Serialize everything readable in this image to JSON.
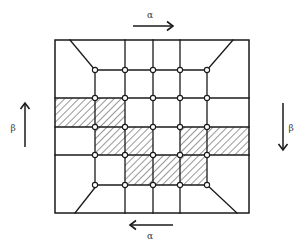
{
  "diagram": {
    "colors": {
      "ink": "#1a1a1a",
      "background": "#ffffff",
      "label": "#444444"
    },
    "frame": {
      "left": 55,
      "top": 40,
      "right": 249,
      "bottom": 213
    },
    "grid_x": [
      95,
      125,
      153,
      180,
      207
    ],
    "grid_y": [
      70,
      98,
      127,
      155,
      185
    ],
    "full_horizontal_rows": [
      98,
      127,
      155
    ],
    "full_vertical_cols": [
      125,
      153,
      180
    ],
    "diagonals": [
      {
        "x1": 70,
        "y1": 40,
        "x2": 95,
        "y2": 70
      },
      {
        "x1": 233,
        "y1": 40,
        "x2": 207,
        "y2": 70
      },
      {
        "x1": 75,
        "y1": 213,
        "x2": 97,
        "y2": 185
      },
      {
        "x1": 237,
        "y1": 213,
        "x2": 207,
        "y2": 185
      }
    ],
    "hatched_cells": [
      {
        "x": 55,
        "y": 98,
        "w": 40,
        "h": 29
      },
      {
        "x": 95,
        "y": 98,
        "w": 30,
        "h": 29
      },
      {
        "x": 95,
        "y": 127,
        "w": 30,
        "h": 28
      },
      {
        "x": 125,
        "y": 127,
        "w": 28,
        "h": 28
      },
      {
        "x": 180,
        "y": 127,
        "w": 27,
        "h": 28
      },
      {
        "x": 207,
        "y": 127,
        "w": 42,
        "h": 28
      },
      {
        "x": 125,
        "y": 155,
        "w": 28,
        "h": 30
      },
      {
        "x": 153,
        "y": 155,
        "w": 27,
        "h": 30
      },
      {
        "x": 180,
        "y": 155,
        "w": 27,
        "h": 30
      }
    ],
    "arrows": {
      "top": {
        "label": "α",
        "direction": "right",
        "x1": 133,
        "y1": 26,
        "x2": 173,
        "y2": 26,
        "label_x": 150,
        "label_y": 18
      },
      "bottom": {
        "label": "α",
        "direction": "left",
        "x1": 173,
        "y1": 225,
        "x2": 130,
        "y2": 225,
        "label_x": 150,
        "label_y": 239
      },
      "left": {
        "label": "β",
        "direction": "up",
        "x1": 25,
        "y1": 147,
        "x2": 25,
        "y2": 103,
        "label_x": 13,
        "label_y": 131
      },
      "right": {
        "label": "β",
        "direction": "down",
        "x1": 283,
        "y1": 103,
        "x2": 283,
        "y2": 150,
        "label_x": 291,
        "label_y": 131
      }
    }
  }
}
